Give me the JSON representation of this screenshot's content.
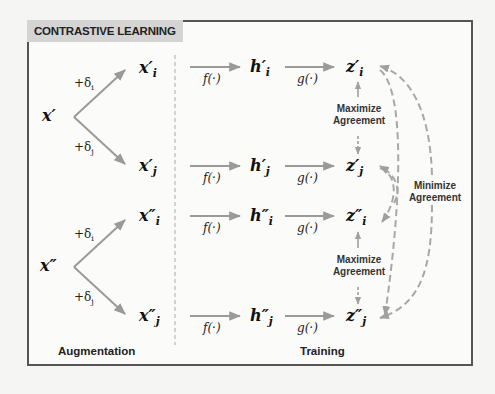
{
  "title": "CONTRASTIVE LEARNING",
  "colors": {
    "arrow": "#9a9a9a",
    "frame": "#555555",
    "title_bg": "#d4d4d4",
    "text": "#111111"
  },
  "inputs": [
    {
      "base": "x",
      "prime": "′"
    },
    {
      "base": "x",
      "prime": "″"
    }
  ],
  "augmentations": {
    "plus_i": "+δ",
    "sub_i": "i",
    "plus_j": "+δ",
    "sub_j": "j"
  },
  "rows": [
    {
      "x": "x",
      "h": "h",
      "z": "z",
      "prime": "′",
      "sub": "i"
    },
    {
      "x": "x",
      "h": "h",
      "z": "z",
      "prime": "′",
      "sub": "j"
    },
    {
      "x": "x",
      "h": "h",
      "z": "z",
      "prime": "″",
      "sub": "i"
    },
    {
      "x": "x",
      "h": "h",
      "z": "z",
      "prime": "″",
      "sub": "j"
    }
  ],
  "functions": {
    "f": "f(·)",
    "g": "g(·)"
  },
  "agreements": {
    "maximize_line1": "Maximize",
    "maximize_line2": "Agreement",
    "minimize_line1": "Minimize",
    "minimize_line2": "Agreement"
  },
  "sections": {
    "augmentation": "Augmentation",
    "training": "Training"
  }
}
